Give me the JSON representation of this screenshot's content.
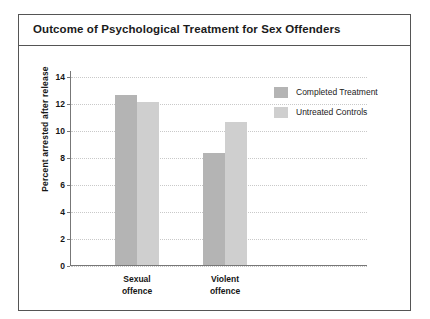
{
  "figure": {
    "title": "Outcome of Psychological Treatment for Sex Offenders"
  },
  "legend": {
    "items": [
      {
        "label": "Completed Treatment",
        "color": "#b4b4b4",
        "swatch": "legend-swatch-dark"
      },
      {
        "label": "Untreated Controls",
        "color": "#cfcfcf",
        "swatch": "legend-swatch-light"
      }
    ]
  },
  "axis": {
    "y_label": "Percent arrested after release",
    "y_ticks": [
      "0",
      "2",
      "4",
      "6",
      "8",
      "10",
      "12",
      "14"
    ],
    "x_categories": [
      {
        "line1": "Sexual",
        "line2": "offence"
      },
      {
        "line1": "Violent",
        "line2": "offence"
      }
    ]
  },
  "chart_data": {
    "type": "bar",
    "title": "Outcome of Psychological Treatment for Sex Offenders",
    "xlabel": "",
    "ylabel": "Percent arrested after release",
    "ylim": [
      0,
      14
    ],
    "ytick_step": 2,
    "grid": true,
    "legend_position": "top-right",
    "categories": [
      "Sexual offence",
      "Violent offence"
    ],
    "series": [
      {
        "name": "Completed Treatment",
        "color": "#b4b4b4",
        "values": [
          12.6,
          8.3
        ]
      },
      {
        "name": "Untreated Controls",
        "color": "#cfcfcf",
        "values": [
          12.1,
          10.6
        ]
      }
    ]
  }
}
